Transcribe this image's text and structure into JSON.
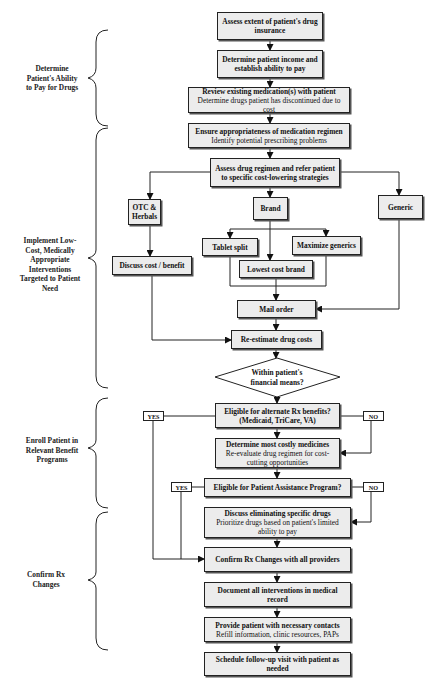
{
  "phases": [
    {
      "id": "ability",
      "lines": [
        "Determine",
        "Patient's Ability",
        "to Pay for Drugs"
      ]
    },
    {
      "id": "implement",
      "lines": [
        "Implement Low-",
        "Cost, Medically",
        "Appropriate",
        "Interventions",
        "Targeted to Patient",
        "Need"
      ]
    },
    {
      "id": "enroll",
      "lines": [
        "Enroll Patient in",
        "Relevant Benefit",
        "Programs"
      ]
    },
    {
      "id": "confirm",
      "lines": [
        "Confirm Rx",
        "Changes"
      ]
    }
  ],
  "steps": {
    "assess_insurance": {
      "title": "Assess extent of patient's drug insurance"
    },
    "determine_income": {
      "title": "Determine patient income and establish ability to pay"
    },
    "review_meds": {
      "title": "Review existing medication(s) with patient",
      "detail": "Determine drugs patient has discontinued due to cost"
    },
    "ensure_regimen": {
      "title": "Ensure appropriateness of medication regimen",
      "detail": "Identify potential prescribing problems"
    },
    "assess_regimen": {
      "title": "Assess drug regimen and refer patient to specific cost-lowering strategies"
    },
    "otc": {
      "title": "OTC & Herbals"
    },
    "brand": {
      "title": "Brand"
    },
    "generic": {
      "title": "Generic"
    },
    "tablet_split": {
      "title": "Tablet split"
    },
    "maximize_generics": {
      "title": "Maximize generics"
    },
    "discuss_cost": {
      "title": "Discuss cost / benefit"
    },
    "lowest_cost_brand": {
      "title": "Lowest cost brand"
    },
    "mail_order": {
      "title": "Mail order"
    },
    "reestimate": {
      "title": "Re-estimate drug costs"
    },
    "decision_means": {
      "title": "Within patient's financial means?"
    },
    "eligible_alt": {
      "title": "Eligible for alternate Rx benefits?",
      "detail": "(Medicaid, TriCare, VA)"
    },
    "most_costly": {
      "title": "Determine most costly medicines",
      "detail": "Re-evaluate drug regimen for cost-cutting opportunities"
    },
    "eligible_pap": {
      "title": "Eligible for Patient Assistance Program?"
    },
    "discuss_eliminating": {
      "title": "Discuss eliminating specific drugs",
      "detail": "Prioritize drugs based on patient's limited ability to pay"
    },
    "confirm_rx": {
      "title": "Confirm Rx Changes with all providers"
    },
    "document": {
      "title": "Document all interventions in medical record"
    },
    "provide_contacts": {
      "title": "Provide patient with necessary contacts",
      "detail": "Refill information, clinic resources, PAPs"
    },
    "schedule": {
      "title": "Schedule follow-up visit with patient as needed"
    }
  },
  "labels": {
    "yes": "YES",
    "no": "NO"
  },
  "colors": {
    "box_fill": "#ececec",
    "line": "#222222",
    "background": "#ffffff"
  }
}
